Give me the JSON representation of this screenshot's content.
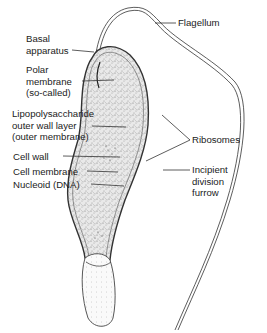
{
  "diagram": {
    "labels": {
      "flagellum": "Flagellum",
      "basal_apparatus": [
        "Basal",
        "apparatus"
      ],
      "polar_membrane": [
        "Polar",
        "membrane",
        "(so-called)"
      ],
      "lps_layer": [
        "Lipopolysaccharide",
        "outer wall layer",
        "(outer membrane)"
      ],
      "cell_wall": "Cell wall",
      "cell_membrane": "Cell membrane",
      "nucleoid": "Nucleoid (DNA)",
      "ribosomes": "Ribosomes",
      "division_furrow": [
        "Incipient",
        "division",
        "furrow"
      ]
    }
  }
}
